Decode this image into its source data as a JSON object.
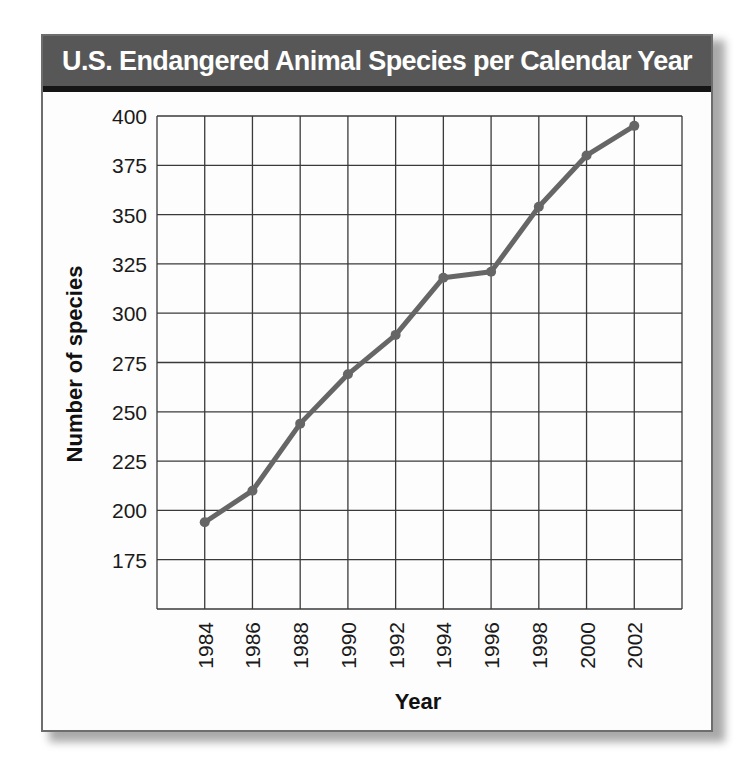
{
  "chart_data": {
    "type": "line",
    "title": "U.S. Endangered Animal Species per Calendar Year",
    "xlabel": "Year",
    "ylabel": "Number of species",
    "x": [
      1984,
      1986,
      1988,
      1990,
      1992,
      1994,
      1996,
      1998,
      2000,
      2002
    ],
    "categories": [
      "1984",
      "1986",
      "1988",
      "1990",
      "1992",
      "1994",
      "1996",
      "1998",
      "2000",
      "2002"
    ],
    "series": [
      {
        "name": "Endangered animal species",
        "values": [
          194,
          210,
          244,
          269,
          289,
          318,
          321,
          354,
          380,
          395
        ]
      }
    ],
    "yticks": [
      175,
      200,
      225,
      250,
      275,
      300,
      325,
      350,
      375,
      400
    ],
    "xticks": [
      "1984",
      "1986",
      "1988",
      "1990",
      "1992",
      "1994",
      "1996",
      "1998",
      "2000",
      "2002"
    ],
    "ylim": [
      150,
      400
    ],
    "xlim": [
      1982,
      2004
    ],
    "grid": true,
    "legend": "none",
    "colors": {
      "line": "#666666",
      "header_bg": "#575757",
      "header_text": "#ffffff",
      "grid": "#3a3a3a"
    }
  }
}
